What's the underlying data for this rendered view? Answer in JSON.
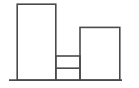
{
  "figure": {
    "kind": "line-drawing",
    "width": 139,
    "height": 88,
    "background_color": "#ffffff",
    "stroke_color": "#4a4a4a",
    "stroke_width": 1.6
  },
  "ground": {
    "name": "ground-line",
    "x1": 9,
    "y1": 80.2,
    "x2": 122,
    "y2": 80.2,
    "stroke_color": "#4a4a4a",
    "stroke_width": 1.7
  },
  "shapes": [
    {
      "name": "left-tall-rectangle",
      "role": "tall left block",
      "x": 17.2,
      "y": 4.2,
      "width": 38.6,
      "height": 76.0,
      "right_edge": 55.8,
      "bottom_edge": 80.2
    },
    {
      "name": "middle-low-block",
      "role": "short middle block with horizontal bands",
      "x": 55.8,
      "y": 56.0,
      "width": 24.2,
      "height": 24.2,
      "right_edge": 80.0,
      "bottom_edge": 80.2
    },
    {
      "name": "right-rectangle",
      "role": "medium right block",
      "x": 80.0,
      "y": 27.4,
      "width": 39.8,
      "height": 52.8,
      "right_edge": 119.8,
      "bottom_edge": 80.2
    }
  ],
  "dividers": [
    {
      "name": "middle-block-band-divider",
      "x1": 55.8,
      "y1": 68.2,
      "x2": 80.0,
      "y2": 68.2
    }
  ],
  "labels": {
    "visible_text": []
  }
}
